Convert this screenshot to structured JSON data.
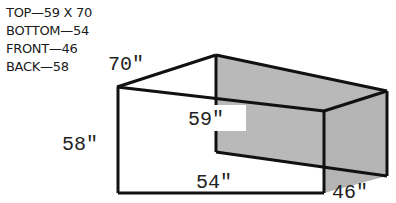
{
  "legend": {
    "lines": [
      "TOP—59 X 70",
      "BOTTOM—54",
      "FRONT—46",
      "BACK—58"
    ]
  },
  "dimensions": {
    "top_depth": "70\"",
    "top_width": "59\"",
    "back_height": "58\"",
    "bottom_width": "54\"",
    "front_height": "46\""
  },
  "colors": {
    "stroke": "#111111",
    "shade": "#b8b8b8",
    "background": "#ffffff"
  }
}
